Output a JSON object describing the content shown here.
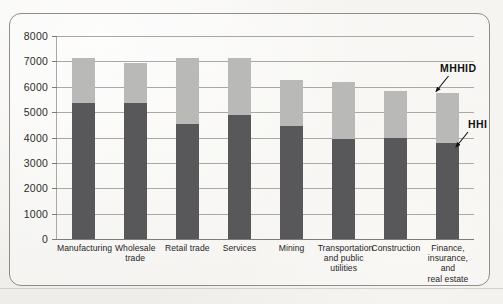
{
  "figure": {
    "background_color": "#f2f1ed",
    "frame_color": "#8e8d89"
  },
  "chart_data": {
    "type": "bar",
    "subtype": "stacked-bar",
    "title": "",
    "subtitle": "",
    "xlabel": "",
    "ylabel": "",
    "ylim": [
      0,
      8000
    ],
    "ytick_step": 1000,
    "grid": true,
    "legend_position": "annotations",
    "categories": [
      "Manufacturing",
      "Wholesale trade",
      "Retail trade",
      "Services",
      "Mining",
      "Transportation and public utilities",
      "Construction",
      "Finance, insurance, and real estate"
    ],
    "category_label_lines": [
      [
        "Manufacturing"
      ],
      [
        "Wholesale",
        "trade"
      ],
      [
        "Retail trade"
      ],
      [
        "Services"
      ],
      [
        "Mining"
      ],
      [
        "Transportation",
        "and public",
        "utilities"
      ],
      [
        "Construction"
      ],
      [
        "Finance,",
        "insurance, and",
        "real estate"
      ]
    ],
    "ytick_labels": [
      "8000",
      "7000",
      "6000",
      "5000",
      "4000",
      "3000",
      "2000",
      "1000",
      "0"
    ],
    "ytick_values": [
      8000,
      7000,
      6000,
      5000,
      4000,
      3000,
      2000,
      1000,
      0
    ],
    "series": [
      {
        "name": "HHI",
        "color": "#58585a",
        "values": [
          5350,
          5350,
          4550,
          4900,
          4450,
          3950,
          4000,
          3800
        ]
      },
      {
        "name": "MHHID",
        "color": "#b9b9b7",
        "values": [
          1800,
          1600,
          2600,
          2250,
          1800,
          2250,
          1850,
          1950
        ]
      }
    ],
    "totals": [
      7150,
      6950,
      7150,
      7150,
      6250,
      6200,
      5850,
      5750
    ],
    "annotations": [
      {
        "label": "MHHID",
        "target_series": "MHHID",
        "target_category": "Finance, insurance, and real estate"
      },
      {
        "label": "HHI",
        "target_series": "HHI",
        "target_category": "Finance, insurance, and real estate"
      }
    ]
  }
}
